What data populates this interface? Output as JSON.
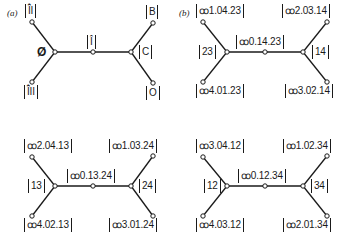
{
  "panels": {
    "a": {
      "tag": "(a)",
      "root_label": "Ø",
      "top_left": "Î̂I",
      "bottom_left": "Î̂II",
      "middle": "Î",
      "right_junction": "C",
      "top_right": "B",
      "bottom_right": "O"
    },
    "b": {
      "tag": "(b)",
      "top_left": "ꝏ1.04.23",
      "bottom_left": "ꝏ4.01.23",
      "left_junction": "23",
      "middle": "ꝏ0.14.23",
      "right_junction": "14",
      "top_right": "ꝏ2.03.14",
      "bottom_right": "ꝏ3.02.14"
    },
    "c": {
      "top_left": "ꝏ2.04.13",
      "bottom_left": "ꝏ4.02.13",
      "left_junction": "13",
      "middle": "ꝏ0.13.24",
      "right_junction": "24",
      "top_right": "ꝏ1.03.24",
      "bottom_right": "ꝏ3.01.24"
    },
    "d": {
      "top_left": "ꝏ3.04.12",
      "bottom_left": "ꝏ4.03.12",
      "left_junction": "12",
      "middle": "ꝏ0.12.34",
      "right_junction": "34",
      "top_right": "ꝏ1.02.34",
      "bottom_right": "ꝏ2.01.34"
    }
  }
}
